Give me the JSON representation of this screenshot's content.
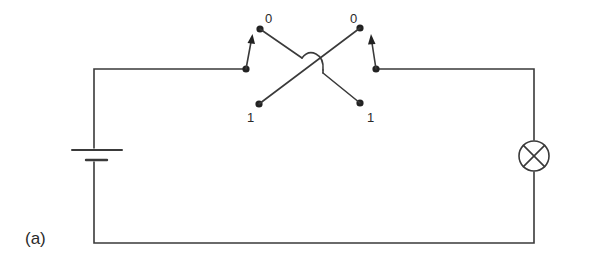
{
  "figure": {
    "caption": "(a)",
    "type": "two-way switch circuit (staircase wiring)"
  },
  "components": {
    "battery": {
      "symbol": "cell",
      "position": "left"
    },
    "lamp": {
      "symbol": "circle-with-cross",
      "position": "right"
    },
    "switch_left": {
      "contact_top_label": "0",
      "contact_bottom_label": "1"
    },
    "switch_right": {
      "contact_top_label": "0",
      "contact_bottom_label": "1"
    }
  },
  "colors": {
    "line": "#3a3a3a",
    "background": "#ffffff"
  }
}
